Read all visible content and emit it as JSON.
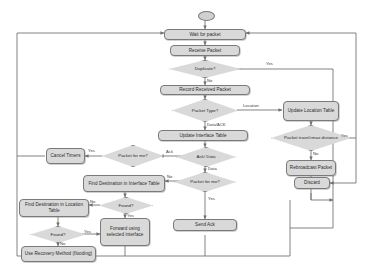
{
  "diagram": {
    "type": "flowchart",
    "colors": {
      "node_fill": "#d9d9d9",
      "node_border": "#7a7a7a",
      "line": "#6e6e6e",
      "text": "#2b2b2b"
    }
  },
  "nodes": {
    "start": "",
    "wait_for_packet": "Wait for packet",
    "receive_packet": "Receive Packet",
    "duplicate": "Duplicate?",
    "record_received_packet": "Record Received Packet",
    "packet_type": "Packet Type?",
    "update_location_table": "Update Location Table",
    "update_interface_table": "Update Interface Table",
    "packet_travel_max": "Packet travel>max distance",
    "rebroadcast_packet": "Rebroadcast Packet",
    "discard": "Discard",
    "packet_for_me_1": "Packet for me?",
    "cancel_timers": "Cancel Timers",
    "ack_data": "Ack/ Data",
    "packet_for_me_2": "Packet for me?",
    "find_dest_interface": "Find Destination in Interface Table",
    "found_1": "Found?",
    "find_dest_location": "Find Destination in Location Table",
    "found_2": "Found?",
    "forward_using_interface": "Forward using selected interface",
    "use_recovery_method": "Use Recovery Method (flooding)",
    "send_ack": "Send Ack"
  },
  "edge_labels": {
    "duplicate_yes": "Yes",
    "duplicate_no": "No",
    "type_location": "Location",
    "type_data_ack": "Data/ACK",
    "travel_yes": "Yes",
    "travel_no": "No",
    "forme1_yes": "Yes",
    "forme1_ack": "Ack",
    "ackdata_data": "Data",
    "forme2_no": "No",
    "forme2_yes": "Yes",
    "found1_no": "No",
    "found1_yes": "Yes",
    "found2_no": "No",
    "found2_yes": "Yes"
  }
}
